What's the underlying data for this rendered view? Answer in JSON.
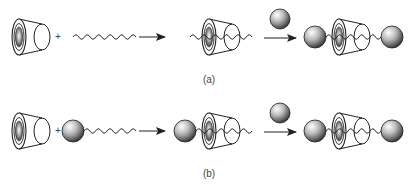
{
  "diagram": {
    "panels": [
      {
        "id": "a",
        "label": "(a)",
        "plus": "+",
        "reactants": [
          "cyclodextrin-cone",
          "bare-axle"
        ],
        "intermediate": "pseudorotaxane (axle threaded through cone)",
        "reagent_above_arrow": "stopper-ball",
        "product": "rotaxane (axle capped by two stopper balls)"
      },
      {
        "id": "b",
        "label": "(b)",
        "plus": "+",
        "reactants": [
          "cyclodextrin-cone",
          "half-stoppered-axle"
        ],
        "intermediate": "semirotaxane (ball-capped axle threaded through cone)",
        "reagent_above_arrow": "stopper-ball",
        "product": "rotaxane (axle capped by two stopper balls)"
      }
    ],
    "colors": {
      "stroke": "#222222",
      "ball_light": "#f2f2f2",
      "ball_dark": "#3a3a3a",
      "background": "#ffffff"
    }
  }
}
